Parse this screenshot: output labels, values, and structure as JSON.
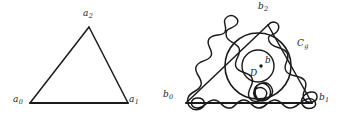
{
  "figure": {
    "background_color": "#ffffff",
    "stroke_color": "#1a1a1a",
    "width": 339,
    "height": 124,
    "left_panel": {
      "name": "simple-triangle",
      "description": "Plain triangle with three labelled vertices",
      "vertices": [
        {
          "id": "a0",
          "label": "a",
          "subscript": "0",
          "x": 30,
          "y": 103,
          "label_x": 13,
          "label_y": 98
        },
        {
          "id": "a1",
          "label": "a",
          "subscript": "1",
          "x": 128,
          "y": 103,
          "label_x": 130,
          "label_y": 98
        },
        {
          "id": "a2",
          "label": "a",
          "subscript": "2",
          "x": 89,
          "y": 27,
          "label_x": 83,
          "label_y": 11
        }
      ]
    },
    "right_panel": {
      "name": "deformed-triangle",
      "description": "Triangle with wavy looping boundary curve, outer circle C_g, inner disc D, centre point b",
      "vertices": [
        {
          "id": "b0",
          "label": "b",
          "subscript": "0",
          "x": 186,
          "y": 103,
          "label_x": 166,
          "label_y": 93
        },
        {
          "id": "b1",
          "label": "b",
          "subscript": "1",
          "x": 312,
          "y": 103,
          "label_x": 319,
          "label_y": 95
        },
        {
          "id": "b2",
          "label": "b",
          "subscript": "2",
          "x": 268,
          "y": 25,
          "label_x": 259,
          "label_y": 3
        }
      ],
      "annotations": [
        {
          "id": "Cg",
          "label": "C",
          "subscript": "g",
          "label_x": 298,
          "label_y": 41
        },
        {
          "id": "D",
          "label": "D",
          "subscript": "",
          "label_x": 253,
          "label_y": 72
        },
        {
          "id": "b",
          "label": "b",
          "subscript": "",
          "label_x": 266,
          "label_y": 60
        }
      ],
      "outer_circle": {
        "cx": 258,
        "cy": 66,
        "r": 33
      },
      "inner_circle": {
        "cx": 258,
        "cy": 66,
        "r": 16
      },
      "centre_point": {
        "cx": 261,
        "cy": 66,
        "r": 1.6
      }
    }
  }
}
